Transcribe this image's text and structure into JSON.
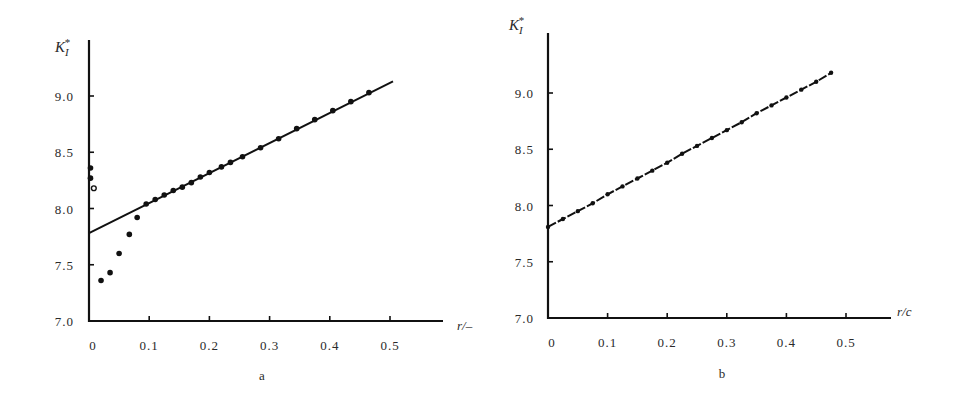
{
  "figure": {
    "panels": [
      {
        "id": "a",
        "caption": "a",
        "ylabel": "K",
        "ylabel_sub": "I",
        "ylabel_sup": "*",
        "xlabel": "r/–"
      },
      {
        "id": "b",
        "caption": "b",
        "ylabel": "K",
        "ylabel_sub": "I",
        "ylabel_sup": "*",
        "xlabel": "r/c"
      }
    ]
  },
  "chart_data": [
    {
      "type": "scatter",
      "panel": "a",
      "title": "",
      "xlabel": "r/–",
      "ylabel": "K_I*",
      "xlim": [
        0,
        0.58
      ],
      "ylim": [
        7.0,
        9.5
      ],
      "x_ticks": [
        "0",
        "0.1",
        "0.2",
        "0.3",
        "0.4",
        "0.5"
      ],
      "y_ticks": [
        "7.0",
        "7.5",
        "8.0",
        "8.5",
        "9.0"
      ],
      "grid": false,
      "legend": null,
      "series": [
        {
          "name": "fit line",
          "kind": "line",
          "x": [
            0.0,
            0.505
          ],
          "y": [
            7.78,
            9.13
          ]
        },
        {
          "name": "data (filled)",
          "kind": "scatter",
          "marker": "filled-circle",
          "x": [
            0.0,
            0.0,
            0.02,
            0.035,
            0.05,
            0.067,
            0.08,
            0.095,
            0.11,
            0.125,
            0.14,
            0.155,
            0.17,
            0.185,
            0.2,
            0.22,
            0.235,
            0.255,
            0.285,
            0.315,
            0.345,
            0.375,
            0.405,
            0.435,
            0.465
          ],
          "y": [
            8.36,
            8.27,
            7.36,
            7.43,
            7.6,
            7.77,
            7.92,
            8.04,
            8.08,
            8.12,
            8.16,
            8.19,
            8.23,
            8.28,
            8.32,
            8.37,
            8.41,
            8.46,
            8.54,
            8.62,
            8.71,
            8.79,
            8.87,
            8.95,
            9.03
          ]
        },
        {
          "name": "data (open)",
          "kind": "scatter",
          "marker": "open-circle",
          "x": [
            0.008
          ],
          "y": [
            8.18
          ]
        }
      ]
    },
    {
      "type": "line",
      "panel": "b",
      "title": "",
      "xlabel": "r/c",
      "ylabel": "K_I*",
      "xlim": [
        0,
        0.57
      ],
      "ylim": [
        7.0,
        9.5
      ],
      "x_ticks": [
        "0",
        "0.1",
        "0.2",
        "0.3",
        "0.4",
        "0.5"
      ],
      "y_ticks": [
        "7.0",
        "7.5",
        "8.0",
        "8.5",
        "9.0"
      ],
      "grid": false,
      "legend": null,
      "series": [
        {
          "name": "fit line with data",
          "kind": "line+scatter",
          "x": [
            0.0,
            0.025,
            0.05,
            0.075,
            0.1,
            0.125,
            0.15,
            0.175,
            0.2,
            0.225,
            0.25,
            0.275,
            0.3,
            0.325,
            0.35,
            0.375,
            0.4,
            0.425,
            0.45,
            0.475
          ],
          "y": [
            7.81,
            7.88,
            7.95,
            8.02,
            8.1,
            8.17,
            8.24,
            8.31,
            8.38,
            8.46,
            8.53,
            8.6,
            8.67,
            8.74,
            8.82,
            8.89,
            8.96,
            9.03,
            9.1,
            9.18
          ]
        }
      ]
    }
  ]
}
